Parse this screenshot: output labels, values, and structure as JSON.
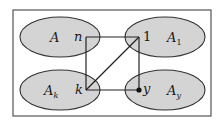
{
  "diagram": {
    "frame": {
      "x": 13,
      "y": 10,
      "w": 198,
      "h": 106,
      "stroke": "#555555"
    },
    "colors": {
      "ellipse_fill": "#d4d4d4",
      "ellipse_stroke": "#333333",
      "line": "#222222"
    },
    "sets": [
      {
        "id": "A",
        "name": "A",
        "sub": "",
        "cx": 60,
        "cy": 37,
        "rx": 40,
        "ry": 20,
        "name_x": 50,
        "name_y": 42
      },
      {
        "id": "A1",
        "name": "A",
        "sub": "1",
        "cx": 165,
        "cy": 37,
        "rx": 40,
        "ry": 20,
        "name_x": 167,
        "name_y": 42
      },
      {
        "id": "Ak",
        "name": "A",
        "sub": "k",
        "cx": 60,
        "cy": 90,
        "rx": 40,
        "ry": 20,
        "name_x": 44,
        "name_y": 95
      },
      {
        "id": "Ay",
        "name": "A",
        "sub": "y",
        "cx": 165,
        "cy": 90,
        "rx": 40,
        "ry": 20,
        "name_x": 167,
        "name_y": 95
      }
    ],
    "nodes": [
      {
        "id": "n",
        "label": "n",
        "x": 86,
        "y": 37,
        "label_x": 74,
        "label_y": 41,
        "style": "italic"
      },
      {
        "id": "1",
        "label": "1",
        "x": 139,
        "y": 37,
        "label_x": 143,
        "label_y": 41,
        "style": "roman"
      },
      {
        "id": "k",
        "label": "k",
        "x": 86,
        "y": 90,
        "label_x": 75,
        "label_y": 94,
        "style": "italic"
      },
      {
        "id": "y",
        "label": "y",
        "x": 139,
        "y": 90,
        "label_x": 143,
        "label_y": 93,
        "style": "italic",
        "dot": true
      }
    ],
    "edges": [
      {
        "from": "n",
        "to": "1"
      },
      {
        "from": "n",
        "to": "k"
      },
      {
        "from": "k",
        "to": "y"
      },
      {
        "from": "1",
        "to": "y"
      },
      {
        "from": "k",
        "to": "1"
      }
    ]
  }
}
